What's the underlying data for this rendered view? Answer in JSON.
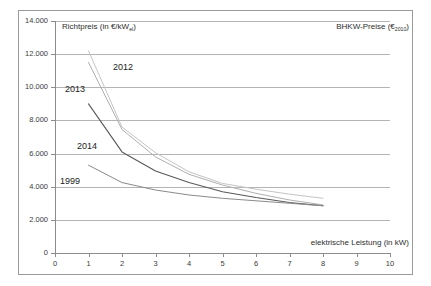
{
  "figure": {
    "right_title": "BHKW-Preise (€2010)",
    "right_title_main": "BHKW-Preise (€",
    "right_title_sub": "2010",
    "right_title_tail": ")",
    "y_axis_caption_main": "Richtpreis (in €/kW",
    "y_axis_caption_sub": "el",
    "y_axis_caption_tail": ")",
    "x_axis_caption": "elektrische Leistung (in kW)"
  },
  "chart_data": {
    "type": "line",
    "title": "BHKW-Preise (€2010)",
    "xlabel": "elektrische Leistung (in kW)",
    "ylabel": "Richtpreis (in €/kWel)",
    "xlim": [
      0,
      10
    ],
    "ylim": [
      0,
      14000
    ],
    "xticks": [
      "0",
      "1",
      "2",
      "3",
      "4",
      "5",
      "6",
      "7",
      "8",
      "9",
      "10"
    ],
    "xtick_values": [
      0,
      1,
      2,
      3,
      4,
      5,
      6,
      7,
      8,
      9,
      10
    ],
    "yticks": [
      "0",
      "2.000",
      "4.000",
      "6.000",
      "8.000",
      "10.000",
      "12.000",
      "14.000"
    ],
    "ytick_values": [
      0,
      2000,
      4000,
      6000,
      8000,
      10000,
      12000,
      14000
    ],
    "grid": "horizontal",
    "legend": "inline-annotations",
    "series": [
      {
        "name": "2012",
        "color": "#c4c4c4",
        "x": [
          1,
          2,
          3,
          4,
          5,
          6,
          7,
          8
        ],
        "values": [
          12200,
          7600,
          6050,
          4900,
          4200,
          3850,
          3550,
          3300
        ]
      },
      {
        "name": "2013",
        "color": "#b0b0b0",
        "x": [
          1,
          2,
          3,
          4,
          5,
          6,
          7,
          8
        ],
        "values": [
          11500,
          7450,
          5800,
          4750,
          4100,
          3600,
          3200,
          2900
        ]
      },
      {
        "name": "2014",
        "color": "#595959",
        "x": [
          1,
          2,
          3,
          4,
          5,
          6,
          7,
          8
        ],
        "values": [
          9000,
          6100,
          4950,
          4250,
          3700,
          3350,
          3050,
          2850
        ]
      },
      {
        "name": "1999",
        "color": "#8a8a8a",
        "x": [
          1,
          2,
          3,
          4,
          5,
          6,
          7,
          8
        ],
        "values": [
          5300,
          4250,
          3800,
          3500,
          3300,
          3150,
          3000,
          2850
        ]
      }
    ],
    "annotations": [
      {
        "text": "2012",
        "x_px": 113,
        "y_px": 62
      },
      {
        "text": "2013",
        "x_px": 65,
        "y_px": 84
      },
      {
        "text": "2014",
        "x_px": 77,
        "y_px": 141
      },
      {
        "text": "1999",
        "x_px": 60,
        "y_px": 176
      }
    ]
  }
}
